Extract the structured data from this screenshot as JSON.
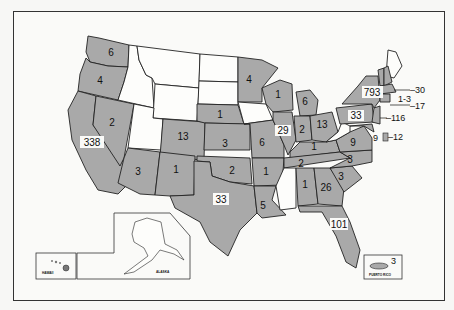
{
  "map": {
    "type": "choropleth",
    "region": "United States",
    "legend_note": "Shaded states carry a count; unshaded states have none",
    "colors": {
      "shaded": "#a9a9a9",
      "unshaded": "#fdfdfb",
      "border": "#222222",
      "frame": "#333333"
    },
    "states": [
      {
        "abbr": "WASH",
        "value": "6",
        "shaded": true
      },
      {
        "abbr": "OREG",
        "value": "4",
        "shaded": true
      },
      {
        "abbr": "CALIF",
        "value": "338",
        "shaded": true
      },
      {
        "abbr": "NEV",
        "value": "2",
        "shaded": true
      },
      {
        "abbr": "IDAHO",
        "value": null,
        "shaded": false
      },
      {
        "abbr": "MONT",
        "value": null,
        "shaded": false
      },
      {
        "abbr": "WYO",
        "value": null,
        "shaded": false
      },
      {
        "abbr": "UTAH",
        "value": null,
        "shaded": false
      },
      {
        "abbr": "COLO",
        "value": "13",
        "shaded": true
      },
      {
        "abbr": "ARIZ",
        "value": "3",
        "shaded": true
      },
      {
        "abbr": "N MEX",
        "value": "1",
        "shaded": true
      },
      {
        "abbr": "N DAK",
        "value": null,
        "shaded": false
      },
      {
        "abbr": "S DAK",
        "value": null,
        "shaded": false
      },
      {
        "abbr": "NEBR",
        "value": "1",
        "shaded": true
      },
      {
        "abbr": "KANS",
        "value": "3",
        "shaded": true
      },
      {
        "abbr": "OKLA",
        "value": "2",
        "shaded": true
      },
      {
        "abbr": "TEX",
        "value": "33",
        "shaded": true
      },
      {
        "abbr": "MINN",
        "value": "4",
        "shaded": true
      },
      {
        "abbr": "IOWA",
        "value": null,
        "shaded": false
      },
      {
        "abbr": "MO",
        "value": "6",
        "shaded": true
      },
      {
        "abbr": "ARK",
        "value": "1",
        "shaded": true
      },
      {
        "abbr": "LA",
        "value": "5",
        "shaded": true
      },
      {
        "abbr": "WIS",
        "value": "1",
        "shaded": true
      },
      {
        "abbr": "ILL",
        "value": "29",
        "shaded": true
      },
      {
        "abbr": "MICH",
        "value": "6",
        "shaded": true
      },
      {
        "abbr": "IND",
        "value": "2",
        "shaded": true
      },
      {
        "abbr": "OHIO",
        "value": "13",
        "shaded": true
      },
      {
        "abbr": "KY",
        "value": "1",
        "shaded": true
      },
      {
        "abbr": "TENN",
        "value": "2",
        "shaded": true
      },
      {
        "abbr": "MISS",
        "value": null,
        "shaded": false
      },
      {
        "abbr": "ALA",
        "value": "1",
        "shaded": true
      },
      {
        "abbr": "GA",
        "value": "26",
        "shaded": true
      },
      {
        "abbr": "FLA",
        "value": "101",
        "shaded": true
      },
      {
        "abbr": "S C",
        "value": "3",
        "shaded": true
      },
      {
        "abbr": "N C",
        "value": "3",
        "shaded": true
      },
      {
        "abbr": "VA",
        "value": "9",
        "shaded": true
      },
      {
        "abbr": "W VA",
        "value": null,
        "shaded": false
      },
      {
        "abbr": "PA",
        "value": "33",
        "shaded": true
      },
      {
        "abbr": "N Y",
        "value": "793",
        "shaded": true
      },
      {
        "abbr": "MAINE",
        "value": null,
        "shaded": false
      },
      {
        "abbr": "N H",
        "value": null,
        "shaded": true
      },
      {
        "abbr": "VT",
        "value": null,
        "shaded": true
      }
    ],
    "callouts": [
      {
        "abbr": "MASS",
        "value": "30"
      },
      {
        "abbr": "R I",
        "value": "1-3"
      },
      {
        "abbr": "CONN",
        "value": "17"
      },
      {
        "abbr": "N J",
        "value": "116"
      },
      {
        "abbr": "MD",
        "value": "9"
      },
      {
        "abbr": "D C",
        "value": "12"
      }
    ],
    "insets": {
      "hawaii": {
        "label": "HAWAII",
        "value": null
      },
      "alaska": {
        "label": "ALASKA",
        "value": null
      },
      "puerto_rico": {
        "label": "PUERTO RICO",
        "value": "3"
      }
    }
  }
}
